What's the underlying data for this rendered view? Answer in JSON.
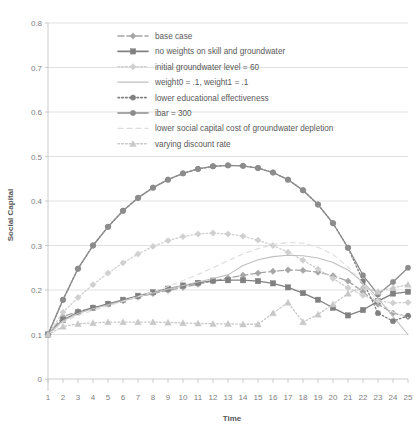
{
  "chart_data": {
    "type": "line",
    "title": "",
    "xlabel": "Time",
    "ylabel": "Social Capital",
    "xlim": [
      1,
      25
    ],
    "ylim": [
      0,
      0.8
    ],
    "ytick_step": 0.1,
    "grid": true,
    "legend_position": "top-center-inside",
    "x": [
      1,
      2,
      3,
      4,
      5,
      6,
      7,
      8,
      9,
      10,
      11,
      12,
      13,
      14,
      15,
      16,
      17,
      18,
      19,
      20,
      21,
      22,
      23,
      24,
      25
    ],
    "xticks": [
      "1",
      "2",
      "3",
      "4",
      "5",
      "6",
      "7",
      "8",
      "9",
      "10",
      "11",
      "12",
      "13",
      "14",
      "15",
      "16",
      "17",
      "18",
      "19",
      "20",
      "21",
      "22",
      "23",
      "24",
      "25"
    ],
    "yticks": [
      "0",
      "0.1",
      "0.2",
      "0.3",
      "0.4",
      "0.5",
      "0.6",
      "0.7",
      "0.8"
    ],
    "series": [
      {
        "name": "base case",
        "marker": "diamond",
        "dash": "dashed",
        "color": "#a6a6a6",
        "values": [
          0.1,
          0.14,
          0.152,
          0.16,
          0.168,
          0.176,
          0.184,
          0.192,
          0.199,
          0.206,
          0.213,
          0.22,
          0.227,
          0.233,
          0.238,
          0.242,
          0.245,
          0.244,
          0.24,
          0.232,
          0.22,
          0.196,
          0.168,
          0.148,
          0.14
        ]
      },
      {
        "name": "no weights on skill and groundwater",
        "marker": "square",
        "dash": "solid",
        "color": "#808080",
        "values": [
          0.1,
          0.133,
          0.15,
          0.16,
          0.169,
          0.178,
          0.187,
          0.195,
          0.203,
          0.21,
          0.216,
          0.221,
          0.222,
          0.222,
          0.22,
          0.215,
          0.206,
          0.193,
          0.178,
          0.16,
          0.143,
          0.155,
          0.175,
          0.192,
          0.196
        ]
      },
      {
        "name": "initial groundwater level = 60",
        "marker": "diamond",
        "dash": "dotted",
        "color": "#d0d0d0",
        "values": [
          0.1,
          0.15,
          0.183,
          0.212,
          0.238,
          0.261,
          0.281,
          0.298,
          0.311,
          0.32,
          0.326,
          0.328,
          0.326,
          0.321,
          0.312,
          0.3,
          0.285,
          0.267,
          0.247,
          0.226,
          0.205,
          0.188,
          0.176,
          0.171,
          0.172
        ]
      },
      {
        "name": "weight0 = .1, weight1 = .1",
        "marker": "none",
        "dash": "solid",
        "color": "#bfbfbf",
        "values": [
          0.1,
          0.131,
          0.147,
          0.158,
          0.167,
          0.176,
          0.185,
          0.193,
          0.202,
          0.21,
          0.218,
          0.226,
          0.234,
          0.255,
          0.268,
          0.275,
          0.278,
          0.277,
          0.272,
          0.262,
          0.245,
          0.218,
          0.182,
          0.14,
          0.1
        ]
      },
      {
        "name": "lower educational effectiveness",
        "marker": "circle",
        "dash": "dotted",
        "color": "#7f7f7f",
        "values": [
          0.1,
          0.178,
          0.248,
          0.3,
          0.342,
          0.378,
          0.407,
          0.43,
          0.448,
          0.462,
          0.472,
          0.478,
          0.48,
          0.479,
          0.474,
          0.464,
          0.448,
          0.424,
          0.392,
          0.35,
          0.295,
          0.22,
          0.148,
          0.13,
          0.142
        ]
      },
      {
        "name": "ibar = 300",
        "marker": "circle",
        "dash": "solid",
        "color": "#8c8c8c",
        "values": [
          0.1,
          0.178,
          0.248,
          0.3,
          0.342,
          0.378,
          0.407,
          0.43,
          0.448,
          0.462,
          0.472,
          0.478,
          0.48,
          0.479,
          0.474,
          0.464,
          0.448,
          0.424,
          0.392,
          0.35,
          0.295,
          0.233,
          0.19,
          0.218,
          0.25
        ]
      },
      {
        "name": "lower social capital cost of groundwater depletion",
        "marker": "none",
        "dash": "dashed-light",
        "color": "#dcdcdc",
        "values": [
          0.1,
          0.128,
          0.143,
          0.154,
          0.164,
          0.174,
          0.185,
          0.196,
          0.208,
          0.221,
          0.235,
          0.25,
          0.266,
          0.281,
          0.293,
          0.302,
          0.307,
          0.305,
          0.296,
          0.28,
          0.252,
          0.214,
          0.176,
          0.15,
          0.138
        ]
      },
      {
        "name": "varying discount rate",
        "marker": "triangle",
        "dash": "dotted",
        "color": "#c8c8c8",
        "values": [
          0.1,
          0.118,
          0.124,
          0.126,
          0.128,
          0.128,
          0.128,
          0.128,
          0.127,
          0.126,
          0.125,
          0.124,
          0.124,
          0.123,
          0.123,
          0.148,
          0.172,
          0.128,
          0.145,
          0.168,
          0.192,
          0.208,
          0.196,
          0.205,
          0.212
        ]
      }
    ]
  },
  "legend": {
    "entries": [
      {
        "label": "base case"
      },
      {
        "label": "no weights on skill and groundwater"
      },
      {
        "label": "initial groundwater level = 60"
      },
      {
        "label": "weight0 = .1, weight1 = .1"
      },
      {
        "label": "lower educational effectiveness"
      },
      {
        "label": "ibar = 300"
      },
      {
        "label": "lower social capital cost of groundwater depletion"
      },
      {
        "label": "varying discount rate"
      }
    ]
  },
  "axes": {
    "y_title": "Social Capital",
    "x_title": "Time"
  }
}
